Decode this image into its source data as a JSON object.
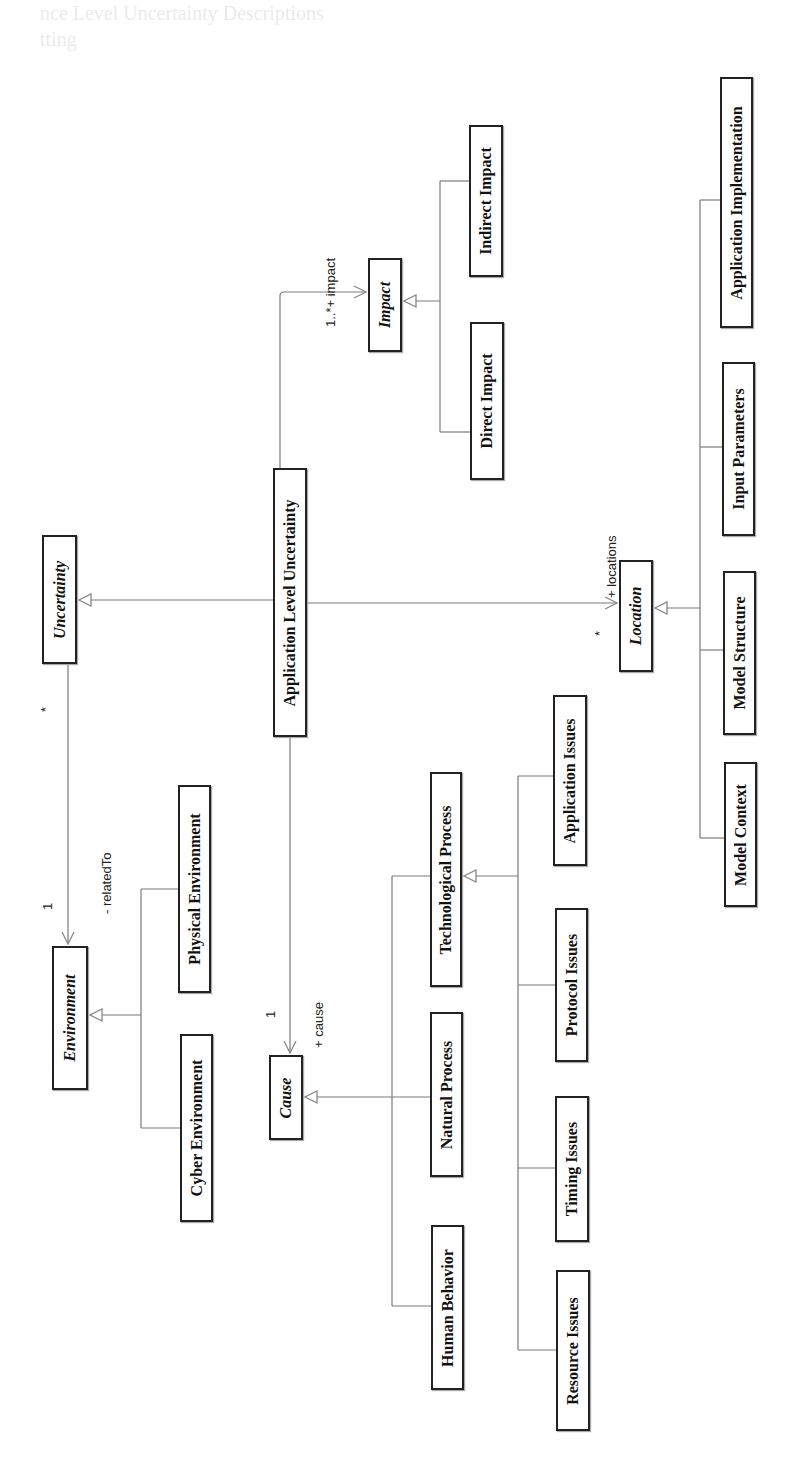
{
  "page": {
    "ghost_heading_line1": "nce Level Uncertainty Descriptions",
    "ghost_heading_line2": "tting"
  },
  "diagram": {
    "classes": {
      "uncertainty": "Uncertainty",
      "application_level_uncertainty": "Application Level Uncertainty",
      "impact": "Impact",
      "direct_impact": "Direct Impact",
      "indirect_impact": "Indirect Impact",
      "location": "Location",
      "application_implementation": "Application Implementation",
      "input_parameters": "Input Parameters",
      "model_structure": "Model Structure",
      "model_context": "Model Context",
      "environment": "Environment",
      "physical_environment": "Physical Environment",
      "cyber_environment": "Cyber Environment",
      "cause": "Cause",
      "technological_process": "Technological Process",
      "natural_process": "Natural Process",
      "human_behavior": "Human Behavior",
      "application_issues": "Application Issues",
      "protocol_issues": "Protocol Issues",
      "timing_issues": "Timing Issues",
      "resource_issues": "Resource Issues"
    },
    "associations": {
      "impact_role": "1..*+ impact",
      "location_role": "+ locations",
      "location_mult": "*",
      "cause_role": "+ cause",
      "cause_mult": "1",
      "env_role": "- relatedTo",
      "env_mult": "1",
      "uncert_mult": "*"
    },
    "generalizations": [
      {
        "parent": "Uncertainty",
        "children": [
          "Application Level Uncertainty"
        ]
      },
      {
        "parent": "Impact",
        "children": [
          "Direct Impact",
          "Indirect Impact"
        ]
      },
      {
        "parent": "Location",
        "children": [
          "Application Implementation",
          "Input Parameters",
          "Model Structure",
          "Model Context"
        ]
      },
      {
        "parent": "Environment",
        "children": [
          "Physical Environment",
          "Cyber Environment"
        ]
      },
      {
        "parent": "Cause",
        "children": [
          "Technological Process",
          "Natural Process",
          "Human Behavior"
        ]
      },
      {
        "parent": "Technological Process",
        "children": [
          "Application Issues",
          "Protocol Issues",
          "Timing Issues",
          "Resource Issues"
        ]
      }
    ],
    "colors": {
      "line": "#777777",
      "box_border": "#222222",
      "text": "#111111"
    }
  }
}
